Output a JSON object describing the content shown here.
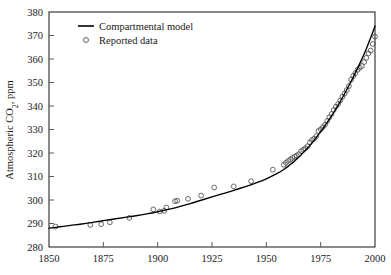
{
  "chart_data": {
    "type": "line",
    "title": "",
    "xlabel": "",
    "ylabel": "Atmospheric CO2, ppm",
    "ylabel_parts": {
      "pre": "Atmospheric CO",
      "sub": "2",
      "post": ", ppm"
    },
    "xlim": [
      1850,
      2000
    ],
    "ylim": [
      280,
      380
    ],
    "xticks": [
      1850,
      1875,
      1900,
      1925,
      1950,
      1975,
      2000
    ],
    "xtick_labels": [
      "1850",
      "1875",
      "1900",
      "1925",
      "1950",
      "1975",
      "2000"
    ],
    "yticks": [
      280,
      290,
      300,
      310,
      320,
      330,
      340,
      350,
      360,
      370,
      380
    ],
    "ytick_labels": [
      "280",
      "290",
      "300",
      "310",
      "320",
      "330",
      "340",
      "350",
      "360",
      "370",
      "380"
    ],
    "grid": false,
    "legend_position": "top-left",
    "series": [
      {
        "name": "Compartmental model",
        "type": "line",
        "marker": "none",
        "color": "#000000",
        "x": [
          1850,
          1855,
          1860,
          1865,
          1870,
          1875,
          1880,
          1885,
          1890,
          1895,
          1900,
          1905,
          1910,
          1915,
          1920,
          1925,
          1930,
          1935,
          1940,
          1945,
          1950,
          1955,
          1958,
          1960,
          1962,
          1964,
          1966,
          1968,
          1970,
          1972,
          1974,
          1976,
          1978,
          1980,
          1982,
          1984,
          1986,
          1988,
          1990,
          1992,
          1994,
          1996,
          1998,
          2000
        ],
        "values": [
          288.0,
          288.6,
          289.2,
          289.8,
          290.5,
          291.2,
          291.9,
          292.6,
          293.3,
          294.1,
          295.0,
          296.0,
          297.2,
          298.5,
          299.9,
          301.3,
          302.7,
          304.1,
          305.6,
          307.2,
          309.0,
          311.3,
          313.0,
          314.3,
          315.8,
          317.4,
          319.2,
          321.1,
          323.2,
          325.4,
          327.8,
          330.3,
          333.0,
          335.8,
          338.8,
          341.9,
          345.2,
          348.7,
          352.3,
          356.1,
          360.1,
          364.3,
          369.0,
          374.0
        ]
      },
      {
        "name": "Reported data",
        "type": "scatter",
        "marker": "open-circle",
        "color": "#3a3a3a",
        "x": [
          1853,
          1869,
          1874,
          1878,
          1887,
          1898,
          1901,
          1903,
          1904,
          1908,
          1909,
          1914,
          1920,
          1926,
          1935,
          1943,
          1953,
          1958,
          1959,
          1960,
          1961,
          1962,
          1963,
          1964,
          1965,
          1966,
          1967,
          1968,
          1969,
          1970,
          1971,
          1972,
          1973,
          1974,
          1975,
          1976,
          1977,
          1978,
          1979,
          1980,
          1981,
          1982,
          1983,
          1984,
          1985,
          1986,
          1987,
          1988,
          1989,
          1990,
          1991,
          1992,
          1993,
          1994,
          1995,
          1996,
          1997,
          1998,
          1999,
          2000
        ],
        "values": [
          288.7,
          289.4,
          289.7,
          290.5,
          292.4,
          296.0,
          295.1,
          295.4,
          296.8,
          299.5,
          299.7,
          300.5,
          301.9,
          305.3,
          305.8,
          308.0,
          312.9,
          315.0,
          315.8,
          316.6,
          317.2,
          317.9,
          318.4,
          318.9,
          319.5,
          320.8,
          321.4,
          322.0,
          322.9,
          324.5,
          325.5,
          326.1,
          327.2,
          329.4,
          330.1,
          331.0,
          332.0,
          333.6,
          335.2,
          336.6,
          338.3,
          339.7,
          340.8,
          342.3,
          343.9,
          345.3,
          346.8,
          348.5,
          351.2,
          352.8,
          354.0,
          355.4,
          356.3,
          357.0,
          358.7,
          360.5,
          362.4,
          363.6,
          366.4,
          369.5
        ]
      }
    ],
    "legend_entries": [
      {
        "label": "Compartmental model",
        "marker": "line"
      },
      {
        "label": "Reported data",
        "marker": "open-circle"
      }
    ]
  }
}
